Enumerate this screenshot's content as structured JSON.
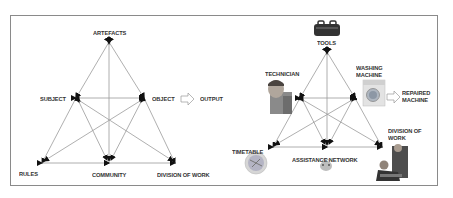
{
  "left_diagram": {
    "title": "Activity system (generic)",
    "nodes": {
      "artefacts": "ARTEFACTS",
      "subject": "SUBJECT",
      "object": "OBJECT",
      "output": "OUTPUT",
      "rules": "RULES",
      "community": "COMMUNITY",
      "division": "DIVISION OF WORK"
    }
  },
  "right_diagram": {
    "title": "Activity system (washing machine repair)",
    "nodes": {
      "tools": "TOOLS",
      "technician": "TECHNICIAN",
      "washing_machine_1": "WASHING",
      "washing_machine_2": "MACHINE",
      "repaired_1": "REPAIRED",
      "repaired_2": "MACHINE",
      "timetable": "TIMETABLE",
      "assistance": "ASSISTANCE NETWORK",
      "division_1": "DIVISION OF",
      "division_2": "WORK"
    },
    "icons": [
      "toolbox-icon",
      "technician-photo",
      "washing-machine-photo",
      "clock-timetable-icon",
      "assistance-network-icon",
      "division-of-work-photo"
    ]
  },
  "colors": {
    "line": "#9a9a9a",
    "arrow": "#111111",
    "text": "#333333",
    "frame": "#8a8a8a"
  }
}
